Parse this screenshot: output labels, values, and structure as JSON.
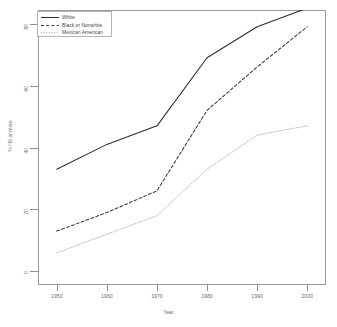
{
  "chart_data": {
    "type": "line",
    "title": "",
    "xlabel": "Year",
    "ylabel": "% HS or more",
    "x": [
      1950,
      1960,
      1970,
      1980,
      1990,
      2000
    ],
    "xlim": [
      1950,
      2000
    ],
    "ylim": [
      0,
      80
    ],
    "xticks": [
      "1950",
      "1960",
      "1970",
      "1980",
      "1990",
      "2000"
    ],
    "yticks": [
      "0",
      "20",
      "40",
      "60",
      "80"
    ],
    "ytick_values": [
      0,
      20,
      40,
      60,
      80
    ],
    "grid": false,
    "legend_position": "top-left",
    "series": [
      {
        "name": "White",
        "linestyle": "solid",
        "color": "#2b2b2b",
        "values": [
          33.0,
          41.0,
          47.0,
          69.0,
          79.0,
          85.0
        ]
      },
      {
        "name": "Black or Nonwhite",
        "linestyle": "dashed",
        "color": "#3a3a3a",
        "values": [
          13.0,
          19.0,
          26.0,
          52.0,
          66.0,
          79.0
        ]
      },
      {
        "name": "Mexican American",
        "linestyle": "dotted",
        "color": "#b0b0b0",
        "values": [
          6.0,
          12.0,
          18.0,
          33.0,
          44.0,
          47.0
        ]
      }
    ]
  },
  "axis": {
    "x_title": "Year",
    "y_title": "% HS or more"
  },
  "legend": {
    "items": [
      {
        "label": "White",
        "style": "solid"
      },
      {
        "label": "Black or Nonwhite",
        "style": "dashed"
      },
      {
        "label": "Mexican American",
        "style": "dotted"
      }
    ]
  }
}
